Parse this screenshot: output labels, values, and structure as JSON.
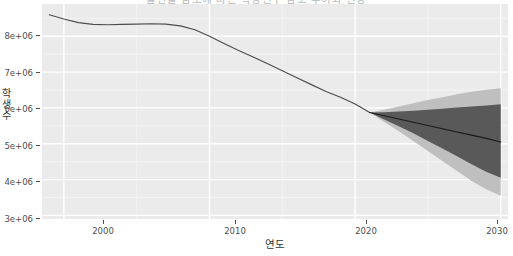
{
  "chart_data": {
    "type": "line",
    "title": "출산율 감소에 따른 학령인구 감소 추이와 전망",
    "xlabel": "연도",
    "ylabel": "학생수",
    "xlim": [
      1998.5,
      2030.5
    ],
    "ylim": [
      2900000,
      8900000
    ],
    "xticks": [
      2000,
      2010,
      2020,
      2030
    ],
    "xtick_labels": [
      "2000",
      "2010",
      "2020",
      "2030"
    ],
    "yticks": [
      3000000,
      4000000,
      5000000,
      6000000,
      7000000,
      8000000
    ],
    "ytick_labels": [
      "3e+06",
      "4e+06",
      "5e+06",
      "6e+06",
      "7e+06",
      "8e+06"
    ],
    "grid": true,
    "legend": "none",
    "theme": "ggplot2-grey",
    "panel_background": "#ebebeb",
    "gridline_color": "#ffffff",
    "line_color": "#4d4d4d",
    "forecast_line_color": "#000000",
    "band_80_color": "#595959",
    "band_95_color": "#bfbfbf",
    "series": [
      {
        "name": "historical",
        "x": [
          1999,
          2000,
          2001,
          2002,
          2003,
          2004,
          2005,
          2006,
          2007,
          2008,
          2009,
          2010,
          2011,
          2012,
          2013,
          2014,
          2015,
          2016,
          2017,
          2018,
          2019,
          2020,
          2021
        ],
        "values": [
          8600000,
          8480000,
          8380000,
          8330000,
          8320000,
          8330000,
          8340000,
          8350000,
          8340000,
          8290000,
          8180000,
          8000000,
          7800000,
          7600000,
          7420000,
          7230000,
          7040000,
          6840000,
          6650000,
          6460000,
          6300000,
          6110000,
          5870000
        ]
      },
      {
        "name": "forecast_mean",
        "x": [
          2021,
          2022,
          2023,
          2024,
          2025,
          2026,
          2027,
          2028,
          2029,
          2030
        ],
        "values": [
          5870000,
          5780000,
          5690000,
          5600000,
          5510000,
          5420000,
          5330000,
          5240000,
          5150000,
          5050000
        ]
      },
      {
        "name": "forecast_80_lower",
        "x": [
          2021,
          2022,
          2023,
          2024,
          2025,
          2026,
          2027,
          2028,
          2029,
          2030
        ],
        "values": [
          5870000,
          5680000,
          5490000,
          5290000,
          5080000,
          4870000,
          4650000,
          4430000,
          4220000,
          4050000
        ]
      },
      {
        "name": "forecast_80_upper",
        "x": [
          2021,
          2022,
          2023,
          2024,
          2025,
          2026,
          2027,
          2028,
          2029,
          2030
        ],
        "values": [
          5870000,
          5880000,
          5900000,
          5920000,
          5950000,
          5980000,
          6010000,
          6040000,
          6070000,
          6100000
        ]
      },
      {
        "name": "forecast_95_lower",
        "x": [
          2021,
          2022,
          2023,
          2024,
          2025,
          2026,
          2027,
          2028,
          2029,
          2030
        ],
        "values": [
          5870000,
          5610000,
          5350000,
          5080000,
          4800000,
          4520000,
          4240000,
          3960000,
          3730000,
          3550000
        ]
      },
      {
        "name": "forecast_95_upper",
        "x": [
          2021,
          2022,
          2023,
          2024,
          2025,
          2026,
          2027,
          2028,
          2029,
          2030
        ],
        "values": [
          5870000,
          5950000,
          6040000,
          6130000,
          6220000,
          6300000,
          6380000,
          6450000,
          6510000,
          6550000
        ]
      }
    ]
  }
}
